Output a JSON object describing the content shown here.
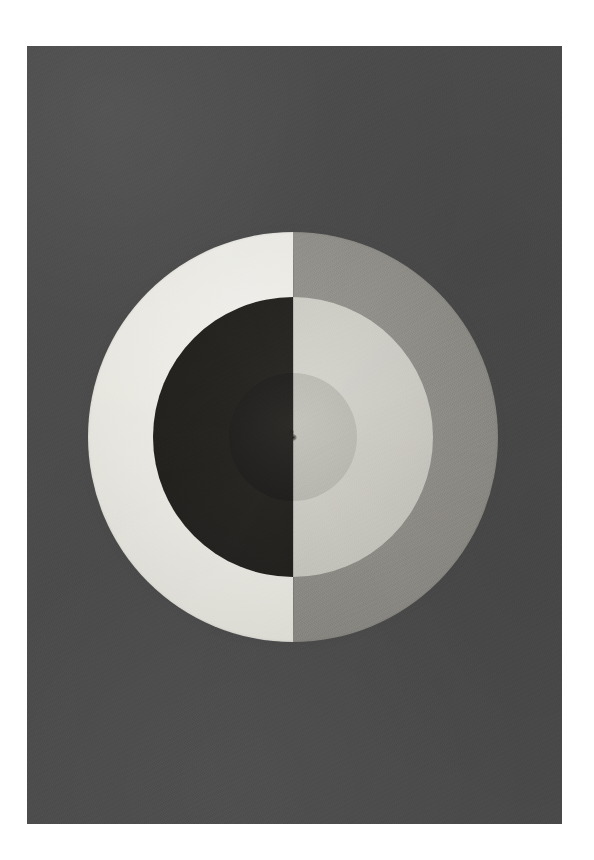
{
  "artwork": {
    "kind": "abstract-painting-reproduction",
    "orientation": "portrait",
    "page_width_px": 594,
    "page_height_px": 860,
    "mount": {
      "color": "#ffffff",
      "left_px": 27,
      "top_px": 46,
      "right_px": 32,
      "bottom_px": 36
    },
    "canvas": {
      "x_px": 27,
      "y_px": 46,
      "width_px": 535,
      "height_px": 778,
      "ground_color": "#4b4b4b",
      "texture": "matte pigment grain"
    },
    "composition": {
      "name": "bisected concentric disc",
      "center_x_px": 293,
      "center_y_px": 437,
      "split_axis": "vertical",
      "rings": [
        {
          "index": 0,
          "name": "outer-ring",
          "outer_radius_px": 205,
          "inner_radius_px": 140,
          "left_color": "#e7e6e0",
          "left_color_name": "warm white",
          "right_color": "#8d8b85",
          "right_color_name": "medium warm grey"
        },
        {
          "index": 1,
          "name": "middle-ring",
          "outer_radius_px": 140,
          "inner_radius_px": 64,
          "left_color": "#222120",
          "left_color_name": "near black",
          "right_color": "#cbcac3",
          "right_color_name": "pale grey"
        },
        {
          "index": 2,
          "name": "inner-disc",
          "outer_radius_px": 64,
          "inner_radius_px": 0,
          "left_color": "#232220",
          "left_color_name": "near black",
          "right_color": "#bcbbb4",
          "right_color_name": "soft grey"
        }
      ],
      "center_mark": {
        "name": "pivot-mark",
        "color": "#1d1c1a",
        "diameter_px": 7
      },
      "seam": {
        "name": "vertical-seam",
        "color": "rgba(0,0,0,0.16)",
        "length_px": 410
      }
    },
    "palette": {
      "ground": "#4b4b4b",
      "warm_white": "#e7e6e0",
      "near_black": "#222120",
      "medium_grey": "#8d8b85",
      "pale_grey": "#cbcac3",
      "soft_grey": "#bcbbb4",
      "mount_white": "#ffffff"
    }
  },
  "caption": {
    "text": ""
  }
}
